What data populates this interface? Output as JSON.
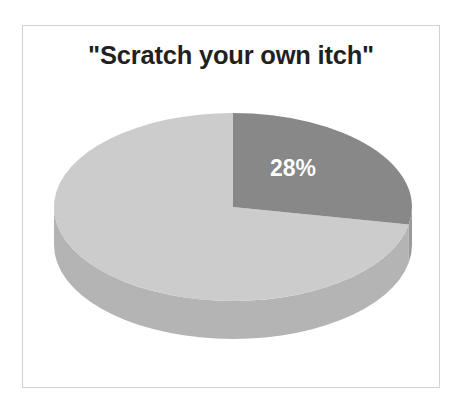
{
  "figure": {
    "title": "\"Scratch your own itch\"",
    "background_color": "#ffffff",
    "frame_color": "#d2d2d2",
    "title_color": "#231f20"
  },
  "chart_data": {
    "type": "pie",
    "title": "\"Scratch your own itch\"",
    "three_d": true,
    "labels": [
      "28%",
      ""
    ],
    "categories": [
      "Slice A",
      "Slice B"
    ],
    "values": [
      28,
      72
    ],
    "data_labels": [
      "28%",
      ""
    ],
    "visible_data_labels": [
      "28%"
    ],
    "colors": [
      "#888888",
      "#cccccc"
    ],
    "side_colors": [
      "#9a9a9a",
      "#b4b4b4"
    ],
    "label_text_color": "#ffffff",
    "start_angle_deg": 0,
    "direction": "clockwise",
    "legend": "none",
    "grid": false,
    "xlabel": "",
    "ylabel": ""
  },
  "geometry": {
    "center_x": 211,
    "center_y": 117,
    "radius_x": 179,
    "radius_y": 94,
    "depth": 38
  }
}
